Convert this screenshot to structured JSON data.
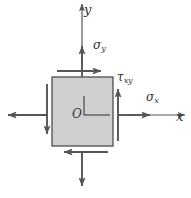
{
  "figure": {
    "colors": {
      "element_fill": "#cfcfcf",
      "element_stroke": "#4d4d4d",
      "arrow": "#555555",
      "axis": "#555555",
      "label": "#333333",
      "background": "#ffffff"
    },
    "element": {
      "shape": "square",
      "x": 52,
      "y": 77,
      "width": 61,
      "height": 69
    },
    "labels": {
      "axis_y": "y",
      "axis_x": "x",
      "sigma_y": "σ",
      "sigma_y_sub": "y",
      "sigma_x": "σ",
      "sigma_x_sub": "x",
      "tau_xy": "τ",
      "tau_xy_sub": "xy",
      "origin": "O"
    },
    "arrows": [
      {
        "name": "sigma-y-top",
        "label": "σy",
        "direction": "up",
        "position": "top-outward"
      },
      {
        "name": "sigma-y-bottom",
        "label": "σy",
        "direction": "down",
        "position": "bottom-outward"
      },
      {
        "name": "sigma-x-right",
        "label": "σx",
        "direction": "right",
        "position": "right-outward"
      },
      {
        "name": "sigma-x-left",
        "label": "σx",
        "direction": "left",
        "position": "left-outward"
      },
      {
        "name": "tau-xy-top",
        "label": "τxy",
        "direction": "right",
        "position": "top-edge"
      },
      {
        "name": "tau-xy-bottom",
        "label": "τxy",
        "direction": "left",
        "position": "bottom-edge"
      },
      {
        "name": "tau-xy-right",
        "label": "τxy",
        "direction": "up",
        "position": "right-edge"
      },
      {
        "name": "tau-xy-left",
        "label": "τxy",
        "direction": "down",
        "position": "left-edge"
      }
    ]
  }
}
